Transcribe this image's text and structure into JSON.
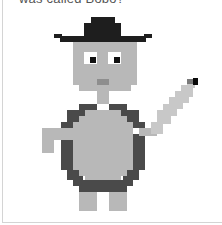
{
  "caption": "was called Bobo?",
  "colors": {
    "hat": "#1e1e1e",
    "skin": "#b8b8b8",
    "eye_white": "#ffffff",
    "pupil": "#111111",
    "mouth": "#8e8e8e",
    "shell": "#4a4a4a",
    "feather": "#c8c8c8",
    "feather_tip": "#0a0a0a",
    "feather_mid": "#7a7a7a"
  },
  "sprite": [
    {
      "part": "hat-crown",
      "c": "hat",
      "x": 91,
      "y": 17,
      "w": 24,
      "h": 7
    },
    {
      "part": "hat-crown-lower",
      "c": "hat",
      "x": 84,
      "y": 23,
      "w": 37,
      "h": 13
    },
    {
      "part": "hat-brim",
      "c": "hat",
      "x": 60,
      "y": 36,
      "w": 86,
      "h": 6
    },
    {
      "part": "hat-brim-left-tip",
      "c": "hat",
      "x": 54,
      "y": 34,
      "w": 8,
      "h": 4
    },
    {
      "part": "hat-brim-right-tip",
      "c": "hat",
      "x": 144,
      "y": 34,
      "w": 8,
      "h": 4
    },
    {
      "part": "face",
      "c": "skin",
      "x": 73,
      "y": 42,
      "w": 64,
      "h": 43
    },
    {
      "part": "face-chin",
      "c": "skin",
      "x": 79,
      "y": 84,
      "w": 52,
      "h": 7
    },
    {
      "part": "eye-left-white",
      "c": "eye_white",
      "x": 84,
      "y": 52,
      "w": 13,
      "h": 12
    },
    {
      "part": "eye-left-pupil",
      "c": "pupil",
      "x": 90,
      "y": 57,
      "w": 6,
      "h": 6
    },
    {
      "part": "eye-right-white",
      "c": "eye_white",
      "x": 108,
      "y": 52,
      "w": 13,
      "h": 12
    },
    {
      "part": "eye-right-pupil",
      "c": "pupil",
      "x": 114,
      "y": 57,
      "w": 6,
      "h": 6
    },
    {
      "part": "mouth",
      "c": "mouth",
      "x": 97,
      "y": 79,
      "w": 12,
      "h": 6
    },
    {
      "part": "neck",
      "c": "skin",
      "x": 97,
      "y": 91,
      "w": 12,
      "h": 13
    },
    {
      "part": "shell-top-left",
      "c": "shell",
      "x": 79,
      "y": 104,
      "w": 18,
      "h": 6
    },
    {
      "part": "shell-top-right",
      "c": "shell",
      "x": 109,
      "y": 104,
      "w": 18,
      "h": 6
    },
    {
      "part": "shell-upper-left",
      "c": "shell",
      "x": 67,
      "y": 110,
      "w": 18,
      "h": 12
    },
    {
      "part": "shell-upper-right",
      "c": "shell",
      "x": 121,
      "y": 110,
      "w": 18,
      "h": 12
    },
    {
      "part": "shell-shoulder-left",
      "c": "shell",
      "x": 61,
      "y": 122,
      "w": 12,
      "h": 6
    },
    {
      "part": "shell-shoulder-right",
      "c": "shell",
      "x": 133,
      "y": 122,
      "w": 12,
      "h": 6
    },
    {
      "part": "shell-side-left",
      "c": "shell",
      "x": 61,
      "y": 140,
      "w": 12,
      "h": 30
    },
    {
      "part": "shell-side-right",
      "c": "shell",
      "x": 133,
      "y": 134,
      "w": 12,
      "h": 36
    },
    {
      "part": "shell-lower-left",
      "c": "shell",
      "x": 67,
      "y": 170,
      "w": 12,
      "h": 10
    },
    {
      "part": "shell-lower-right",
      "c": "shell",
      "x": 127,
      "y": 170,
      "w": 12,
      "h": 10
    },
    {
      "part": "shell-bottom",
      "c": "shell",
      "x": 79,
      "y": 180,
      "w": 48,
      "h": 12
    },
    {
      "part": "shell-bottom-left-step",
      "c": "shell",
      "x": 73,
      "y": 176,
      "w": 10,
      "h": 10
    },
    {
      "part": "shell-bottom-right-step",
      "c": "shell",
      "x": 123,
      "y": 176,
      "w": 10,
      "h": 10
    },
    {
      "part": "belly-top",
      "c": "skin",
      "x": 85,
      "y": 110,
      "w": 36,
      "h": 6
    },
    {
      "part": "belly-upper",
      "c": "skin",
      "x": 79,
      "y": 116,
      "w": 48,
      "h": 6
    },
    {
      "part": "belly-mid",
      "c": "skin",
      "x": 73,
      "y": 122,
      "w": 60,
      "h": 48
    },
    {
      "part": "belly-low",
      "c": "skin",
      "x": 79,
      "y": 170,
      "w": 48,
      "h": 6
    },
    {
      "part": "belly-bottom",
      "c": "skin",
      "x": 85,
      "y": 176,
      "w": 36,
      "h": 4
    },
    {
      "part": "arm-left",
      "c": "skin",
      "x": 42,
      "y": 128,
      "w": 31,
      "h": 12
    },
    {
      "part": "arm-left-hand",
      "c": "skin",
      "x": 42,
      "y": 140,
      "w": 12,
      "h": 13
    },
    {
      "part": "arm-right",
      "c": "skin",
      "x": 139,
      "y": 128,
      "w": 18,
      "h": 8
    },
    {
      "part": "arm-right-up",
      "c": "feather",
      "x": 151,
      "y": 122,
      "w": 12,
      "h": 12
    },
    {
      "part": "feather-1",
      "c": "feather",
      "x": 157,
      "y": 110,
      "w": 14,
      "h": 14
    },
    {
      "part": "feather-2",
      "c": "feather",
      "x": 163,
      "y": 104,
      "w": 14,
      "h": 12
    },
    {
      "part": "feather-3",
      "c": "feather",
      "x": 169,
      "y": 97,
      "w": 14,
      "h": 12
    },
    {
      "part": "feather-4",
      "c": "feather",
      "x": 175,
      "y": 91,
      "w": 14,
      "h": 12
    },
    {
      "part": "feather-5",
      "c": "feather",
      "x": 181,
      "y": 85,
      "w": 12,
      "h": 12
    },
    {
      "part": "feather-6",
      "c": "feather",
      "x": 187,
      "y": 80,
      "w": 8,
      "h": 8
    },
    {
      "part": "feather-mid",
      "c": "feather_mid",
      "x": 187,
      "y": 79,
      "w": 6,
      "h": 5
    },
    {
      "part": "feather-tip",
      "c": "feather_tip",
      "x": 193,
      "y": 78,
      "w": 5,
      "h": 7
    },
    {
      "part": "foot-left",
      "c": "skin",
      "x": 79,
      "y": 192,
      "w": 18,
      "h": 19
    },
    {
      "part": "foot-right",
      "c": "skin",
      "x": 109,
      "y": 192,
      "w": 18,
      "h": 19
    }
  ]
}
